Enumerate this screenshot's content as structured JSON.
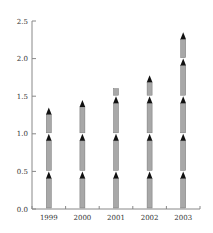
{
  "chart_data": {
    "type": "bar",
    "style": "pictograph-stacked-arrows",
    "title": "",
    "xlabel": "",
    "ylabel": "",
    "categories": [
      "1999",
      "2000",
      "2001",
      "2002",
      "2003"
    ],
    "values": [
      1.35,
      1.45,
      1.6,
      1.78,
      2.35
    ],
    "ylim": [
      0.0,
      2.5
    ],
    "yticks": [
      "0.0",
      "0.5",
      "1.0",
      "1.5",
      "2.0",
      "2.5"
    ],
    "unit_per_icon": 0.5,
    "grid": false,
    "legend": null
  },
  "colors": {
    "axis": "#888888",
    "arrow_tip": "#111111",
    "arrow_shaft": "#a8a8a8",
    "arrow_shaft_edge": "#777777",
    "text": "#333333"
  }
}
